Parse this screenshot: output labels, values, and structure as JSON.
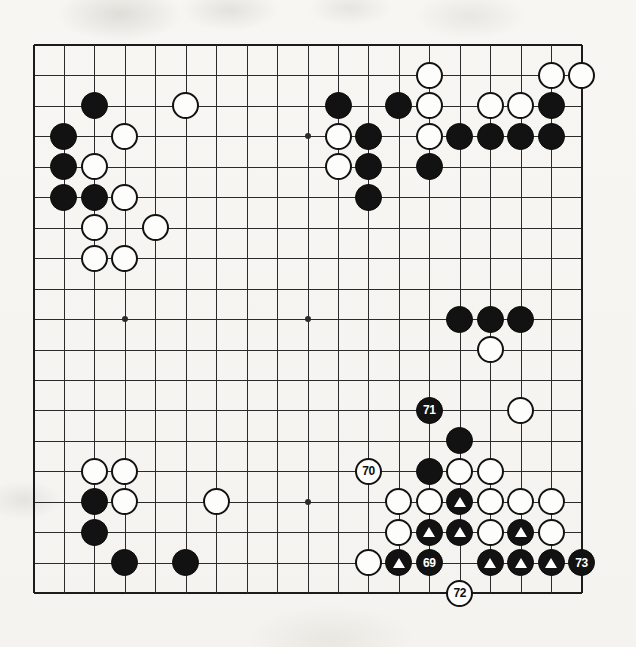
{
  "diagram": {
    "type": "go-game-diagram",
    "board_size": 19,
    "grid": {
      "left": 33.5,
      "top": 45.0,
      "spacing": 30.45,
      "lines": 19,
      "star_points": [
        [
          3,
          3
        ],
        [
          9,
          3
        ],
        [
          15,
          3
        ],
        [
          3,
          9
        ],
        [
          9,
          9
        ],
        [
          15,
          9
        ],
        [
          3,
          15
        ],
        [
          9,
          15
        ],
        [
          15,
          15
        ]
      ]
    },
    "colors": {
      "black_stone": "#121212",
      "white_stone": "#fdfdfb",
      "stone_outline": "#121212",
      "grid_line": "#2b2b2b",
      "board_background": "#f6f5f2",
      "black_label_text": "#ffffff",
      "white_label_text": "#101010",
      "marker_triangle": "#ffffff"
    },
    "move_numbers": [
      "69",
      "70",
      "71",
      "72",
      "73"
    ],
    "stones": [
      {
        "col": 2,
        "row": 2,
        "color": "black",
        "label": "",
        "marker": ""
      },
      {
        "col": 5,
        "row": 2,
        "color": "white",
        "label": "",
        "marker": ""
      },
      {
        "col": 1,
        "row": 3,
        "color": "black",
        "label": "",
        "marker": ""
      },
      {
        "col": 3,
        "row": 3,
        "color": "white",
        "label": "",
        "marker": ""
      },
      {
        "col": 1,
        "row": 4,
        "color": "black",
        "label": "",
        "marker": ""
      },
      {
        "col": 2,
        "row": 4,
        "color": "white",
        "label": "",
        "marker": ""
      },
      {
        "col": 1,
        "row": 5,
        "color": "black",
        "label": "",
        "marker": ""
      },
      {
        "col": 2,
        "row": 5,
        "color": "black",
        "label": "",
        "marker": ""
      },
      {
        "col": 3,
        "row": 5,
        "color": "white",
        "label": "",
        "marker": ""
      },
      {
        "col": 2,
        "row": 6,
        "color": "white",
        "label": "",
        "marker": ""
      },
      {
        "col": 4,
        "row": 6,
        "color": "white",
        "label": "",
        "marker": ""
      },
      {
        "col": 2,
        "row": 7,
        "color": "white",
        "label": "",
        "marker": ""
      },
      {
        "col": 3,
        "row": 7,
        "color": "white",
        "label": "",
        "marker": ""
      },
      {
        "col": 13,
        "row": 1,
        "color": "white",
        "label": "",
        "marker": ""
      },
      {
        "col": 17,
        "row": 1,
        "color": "white",
        "label": "",
        "marker": ""
      },
      {
        "col": 18,
        "row": 1,
        "color": "white",
        "label": "",
        "marker": ""
      },
      {
        "col": 10,
        "row": 2,
        "color": "black",
        "label": "",
        "marker": ""
      },
      {
        "col": 12,
        "row": 2,
        "color": "black",
        "label": "",
        "marker": ""
      },
      {
        "col": 13,
        "row": 2,
        "color": "white",
        "label": "",
        "marker": ""
      },
      {
        "col": 15,
        "row": 2,
        "color": "white",
        "label": "",
        "marker": ""
      },
      {
        "col": 16,
        "row": 2,
        "color": "white",
        "label": "",
        "marker": ""
      },
      {
        "col": 17,
        "row": 2,
        "color": "black",
        "label": "",
        "marker": ""
      },
      {
        "col": 10,
        "row": 3,
        "color": "white",
        "label": "",
        "marker": ""
      },
      {
        "col": 11,
        "row": 3,
        "color": "black",
        "label": "",
        "marker": ""
      },
      {
        "col": 13,
        "row": 3,
        "color": "white",
        "label": "",
        "marker": ""
      },
      {
        "col": 14,
        "row": 3,
        "color": "black",
        "label": "",
        "marker": ""
      },
      {
        "col": 15,
        "row": 3,
        "color": "black",
        "label": "",
        "marker": ""
      },
      {
        "col": 16,
        "row": 3,
        "color": "black",
        "label": "",
        "marker": ""
      },
      {
        "col": 17,
        "row": 3,
        "color": "black",
        "label": "",
        "marker": ""
      },
      {
        "col": 10,
        "row": 4,
        "color": "white",
        "label": "",
        "marker": ""
      },
      {
        "col": 11,
        "row": 4,
        "color": "black",
        "label": "",
        "marker": ""
      },
      {
        "col": 13,
        "row": 4,
        "color": "black",
        "label": "",
        "marker": ""
      },
      {
        "col": 11,
        "row": 5,
        "color": "black",
        "label": "",
        "marker": ""
      },
      {
        "col": 14,
        "row": 9,
        "color": "black",
        "label": "",
        "marker": ""
      },
      {
        "col": 15,
        "row": 9,
        "color": "black",
        "label": "",
        "marker": ""
      },
      {
        "col": 16,
        "row": 9,
        "color": "black",
        "label": "",
        "marker": ""
      },
      {
        "col": 15,
        "row": 10,
        "color": "white",
        "label": "",
        "marker": ""
      },
      {
        "col": 13,
        "row": 12,
        "color": "black",
        "label": "71",
        "marker": ""
      },
      {
        "col": 16,
        "row": 12,
        "color": "white",
        "label": "",
        "marker": ""
      },
      {
        "col": 14,
        "row": 13,
        "color": "black",
        "label": "",
        "marker": ""
      },
      {
        "col": 11,
        "row": 14,
        "color": "white",
        "label": "70",
        "marker": ""
      },
      {
        "col": 13,
        "row": 14,
        "color": "black",
        "label": "",
        "marker": ""
      },
      {
        "col": 14,
        "row": 14,
        "color": "white",
        "label": "",
        "marker": ""
      },
      {
        "col": 15,
        "row": 14,
        "color": "white",
        "label": "",
        "marker": ""
      },
      {
        "col": 12,
        "row": 15,
        "color": "white",
        "label": "",
        "marker": ""
      },
      {
        "col": 13,
        "row": 15,
        "color": "white",
        "label": "",
        "marker": ""
      },
      {
        "col": 14,
        "row": 15,
        "color": "black",
        "label": "",
        "marker": "triangle"
      },
      {
        "col": 15,
        "row": 15,
        "color": "white",
        "label": "",
        "marker": ""
      },
      {
        "col": 16,
        "row": 15,
        "color": "white",
        "label": "",
        "marker": ""
      },
      {
        "col": 17,
        "row": 15,
        "color": "white",
        "label": "",
        "marker": ""
      },
      {
        "col": 12,
        "row": 16,
        "color": "white",
        "label": "",
        "marker": ""
      },
      {
        "col": 13,
        "row": 16,
        "color": "black",
        "label": "",
        "marker": "triangle"
      },
      {
        "col": 14,
        "row": 16,
        "color": "black",
        "label": "",
        "marker": "triangle"
      },
      {
        "col": 15,
        "row": 16,
        "color": "white",
        "label": "",
        "marker": ""
      },
      {
        "col": 16,
        "row": 16,
        "color": "black",
        "label": "",
        "marker": "triangle"
      },
      {
        "col": 17,
        "row": 16,
        "color": "white",
        "label": "",
        "marker": ""
      },
      {
        "col": 11,
        "row": 17,
        "color": "white",
        "label": "",
        "marker": ""
      },
      {
        "col": 12,
        "row": 17,
        "color": "black",
        "label": "",
        "marker": "triangle"
      },
      {
        "col": 13,
        "row": 17,
        "color": "black",
        "label": "69",
        "marker": ""
      },
      {
        "col": 15,
        "row": 17,
        "color": "black",
        "label": "",
        "marker": "triangle"
      },
      {
        "col": 16,
        "row": 17,
        "color": "black",
        "label": "",
        "marker": "triangle"
      },
      {
        "col": 17,
        "row": 17,
        "color": "black",
        "label": "",
        "marker": "triangle"
      },
      {
        "col": 18,
        "row": 17,
        "color": "black",
        "label": "73",
        "marker": ""
      },
      {
        "col": 14,
        "row": 18,
        "color": "white",
        "label": "72",
        "marker": ""
      },
      {
        "col": 2,
        "row": 14,
        "color": "white",
        "label": "",
        "marker": ""
      },
      {
        "col": 3,
        "row": 14,
        "color": "white",
        "label": "",
        "marker": ""
      },
      {
        "col": 2,
        "row": 15,
        "color": "black",
        "label": "",
        "marker": ""
      },
      {
        "col": 3,
        "row": 15,
        "color": "white",
        "label": "",
        "marker": ""
      },
      {
        "col": 6,
        "row": 15,
        "color": "white",
        "label": "",
        "marker": ""
      },
      {
        "col": 2,
        "row": 16,
        "color": "black",
        "label": "",
        "marker": ""
      },
      {
        "col": 3,
        "row": 17,
        "color": "black",
        "label": "",
        "marker": ""
      },
      {
        "col": 5,
        "row": 17,
        "color": "black",
        "label": "",
        "marker": ""
      }
    ]
  }
}
